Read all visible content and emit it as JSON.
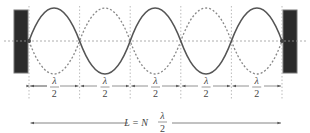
{
  "diagram": {
    "segments": [
      {
        "numerator": "λ",
        "denominator": "2"
      },
      {
        "numerator": "λ",
        "denominator": "2"
      },
      {
        "numerator": "λ",
        "denominator": "2"
      },
      {
        "numerator": "λ",
        "denominator": "2"
      },
      {
        "numerator": "λ",
        "denominator": "2"
      }
    ],
    "length_formula": {
      "lhs": "L = N",
      "numerator": "λ",
      "denominator": "2"
    },
    "colors": {
      "wall": "#2b2b2b",
      "solid_wave": "#555555",
      "dashed_wave": "#888888",
      "guide": "#aaaaaa",
      "text": "#444444"
    }
  }
}
